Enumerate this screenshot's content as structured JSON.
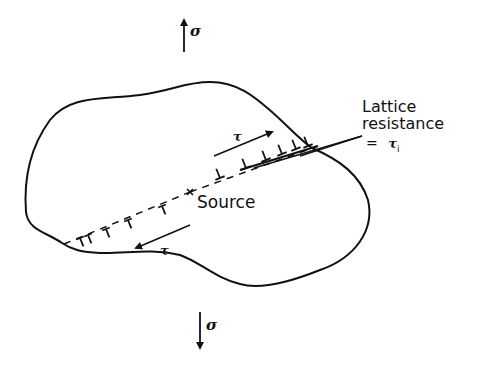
{
  "figure": {
    "stress_top": {
      "symbol": "σ",
      "direction": "up"
    },
    "stress_bottom": {
      "symbol": "σ",
      "direction": "down"
    },
    "shear_upper": {
      "symbol": "τ",
      "direction": "right"
    },
    "shear_lower": {
      "symbol": "τ",
      "direction": "left"
    },
    "source_label": "Source",
    "lattice_label_line1": "Lattice",
    "lattice_label_line2": "resistance",
    "lattice_eq": "=",
    "lattice_symbol": "τ",
    "lattice_subscript": "i"
  }
}
